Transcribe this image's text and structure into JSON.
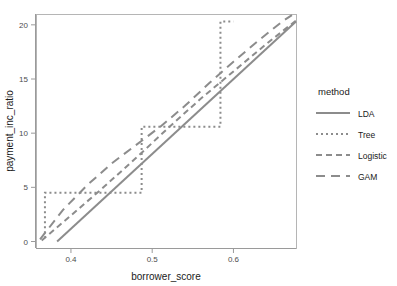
{
  "chart_data": {
    "type": "line",
    "title": "",
    "xlabel": "borrower_score",
    "ylabel": "payment_inc_ratio",
    "xlim": [
      0.357,
      0.677
    ],
    "ylim": [
      -0.6,
      21.0
    ],
    "xticks": [
      0.4,
      0.5,
      0.6
    ],
    "xticklabels": [
      "0.4",
      "0.5",
      "0.6"
    ],
    "yticks": [
      0,
      5,
      10,
      15,
      20
    ],
    "yticklabels": [
      "0",
      "5",
      "10",
      "15",
      "20"
    ],
    "grid": false,
    "legend": {
      "title": "method",
      "position": "right",
      "entries": [
        {
          "label": "LDA",
          "dash": "none",
          "linetype": "solid"
        },
        {
          "label": "Tree",
          "dash": "2,3",
          "linetype": "dotted-dash"
        },
        {
          "label": "Logistic",
          "dash": "6,4",
          "linetype": "dashed"
        },
        {
          "label": "GAM",
          "dash": "9,6",
          "linetype": "long-dashed"
        }
      ]
    },
    "line_color": "#8c8c8c",
    "series": [
      {
        "name": "LDA",
        "dash": "none",
        "points": [
          [
            0.383,
            0.0
          ],
          [
            0.677,
            20.3
          ]
        ]
      },
      {
        "name": "Tree",
        "dash": "2,3",
        "points": [
          [
            0.368,
            0.3
          ],
          [
            0.368,
            4.5
          ],
          [
            0.487,
            4.5
          ],
          [
            0.487,
            10.6
          ],
          [
            0.584,
            10.6
          ],
          [
            0.584,
            20.3
          ],
          [
            0.6,
            20.3
          ]
        ]
      },
      {
        "name": "Logistic",
        "dash": "6,4",
        "points": [
          [
            0.364,
            0.1
          ],
          [
            0.4,
            2.4
          ],
          [
            0.44,
            5.0
          ],
          [
            0.48,
            7.7
          ],
          [
            0.52,
            10.5
          ],
          [
            0.56,
            13.2
          ],
          [
            0.6,
            15.7
          ],
          [
            0.64,
            18.2
          ],
          [
            0.677,
            20.4
          ]
        ]
      },
      {
        "name": "GAM",
        "dash": "9,6",
        "points": [
          [
            0.362,
            0.2
          ],
          [
            0.39,
            2.9
          ],
          [
            0.42,
            5.2
          ],
          [
            0.45,
            7.2
          ],
          [
            0.48,
            8.9
          ],
          [
            0.51,
            10.6
          ],
          [
            0.54,
            12.5
          ],
          [
            0.57,
            14.6
          ],
          [
            0.6,
            16.6
          ],
          [
            0.63,
            18.5
          ],
          [
            0.66,
            20.3
          ],
          [
            0.672,
            20.9
          ]
        ]
      }
    ]
  },
  "panel": {
    "x": 36,
    "y": 14,
    "width": 260,
    "height": 234
  }
}
